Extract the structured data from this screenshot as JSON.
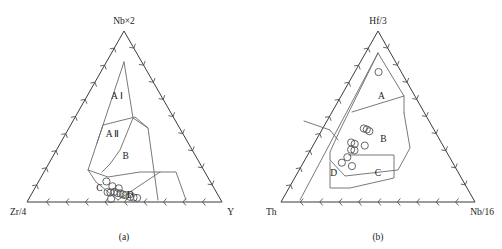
{
  "figure": {
    "caption_a": "(a)",
    "caption_b": "(b)",
    "marker_style": "open-circle",
    "line_color": "#6a6a6a",
    "axis_color": "#3b3b3b",
    "marker_color": "#555555",
    "background": "#ffffff"
  },
  "chart_data": [
    {
      "type": "scatter",
      "plot_kind": "ternary-discrimination-diagram",
      "title": "(a)",
      "panel": "a",
      "grid": false,
      "legend": false,
      "apex_top": "Nb×2",
      "apex_left": "Zr/4",
      "apex_right": "Y",
      "axis_ticks_per_edge": 10,
      "tick_style": "chevron",
      "field_labels": [
        "A Ⅰ",
        "A Ⅱ",
        "B",
        "C",
        "D"
      ],
      "field_label_positions": [
        {
          "label": "A Ⅰ",
          "x": 0.4,
          "y": 0.62
        },
        {
          "label": "A Ⅱ",
          "x": 0.4,
          "y": 0.4
        },
        {
          "label": "B",
          "x": 0.51,
          "y": 0.27
        },
        {
          "label": "C",
          "x": 0.36,
          "y": 0.08
        },
        {
          "label": "D",
          "x": 0.53,
          "y": 0.04
        }
      ],
      "points": [
        {
          "x": 0.395,
          "y": 0.12
        },
        {
          "x": 0.432,
          "y": 0.092
        },
        {
          "x": 0.468,
          "y": 0.08
        },
        {
          "x": 0.408,
          "y": 0.058
        },
        {
          "x": 0.424,
          "y": 0.056
        },
        {
          "x": 0.446,
          "y": 0.06
        },
        {
          "x": 0.462,
          "y": 0.052
        },
        {
          "x": 0.478,
          "y": 0.05
        },
        {
          "x": 0.492,
          "y": 0.044
        },
        {
          "x": 0.506,
          "y": 0.04
        },
        {
          "x": 0.53,
          "y": 0.03
        },
        {
          "x": 0.548,
          "y": 0.026
        },
        {
          "x": 0.566,
          "y": 0.024
        },
        {
          "x": 0.43,
          "y": 0.018
        }
      ],
      "point_count": 14
    },
    {
      "type": "scatter",
      "plot_kind": "ternary-discrimination-diagram",
      "title": "(b)",
      "panel": "b",
      "grid": false,
      "legend": false,
      "apex_top": "Hf/3",
      "apex_left": "Th",
      "apex_right": "Nb/16",
      "axis_ticks_per_edge": 10,
      "tick_style": "chevron",
      "field_labels": [
        "A",
        "B",
        "C",
        "D"
      ],
      "field_label_positions": [
        {
          "label": "A",
          "x": 0.545,
          "y": 0.62
        },
        {
          "label": "B",
          "x": 0.545,
          "y": 0.37
        },
        {
          "label": "C",
          "x": 0.5,
          "y": 0.17
        },
        {
          "label": "D",
          "x": 0.225,
          "y": 0.17
        }
      ],
      "points": [
        {
          "x": 0.512,
          "y": 0.76
        },
        {
          "x": 0.372,
          "y": 0.43
        },
        {
          "x": 0.4,
          "y": 0.424
        },
        {
          "x": 0.424,
          "y": 0.414
        },
        {
          "x": 0.288,
          "y": 0.348
        },
        {
          "x": 0.318,
          "y": 0.34
        },
        {
          "x": 0.398,
          "y": 0.33
        },
        {
          "x": 0.3,
          "y": 0.306
        },
        {
          "x": 0.326,
          "y": 0.302
        },
        {
          "x": 0.286,
          "y": 0.262
        },
        {
          "x": 0.258,
          "y": 0.23
        },
        {
          "x": 0.33,
          "y": 0.21
        }
      ],
      "point_count": 12
    }
  ]
}
